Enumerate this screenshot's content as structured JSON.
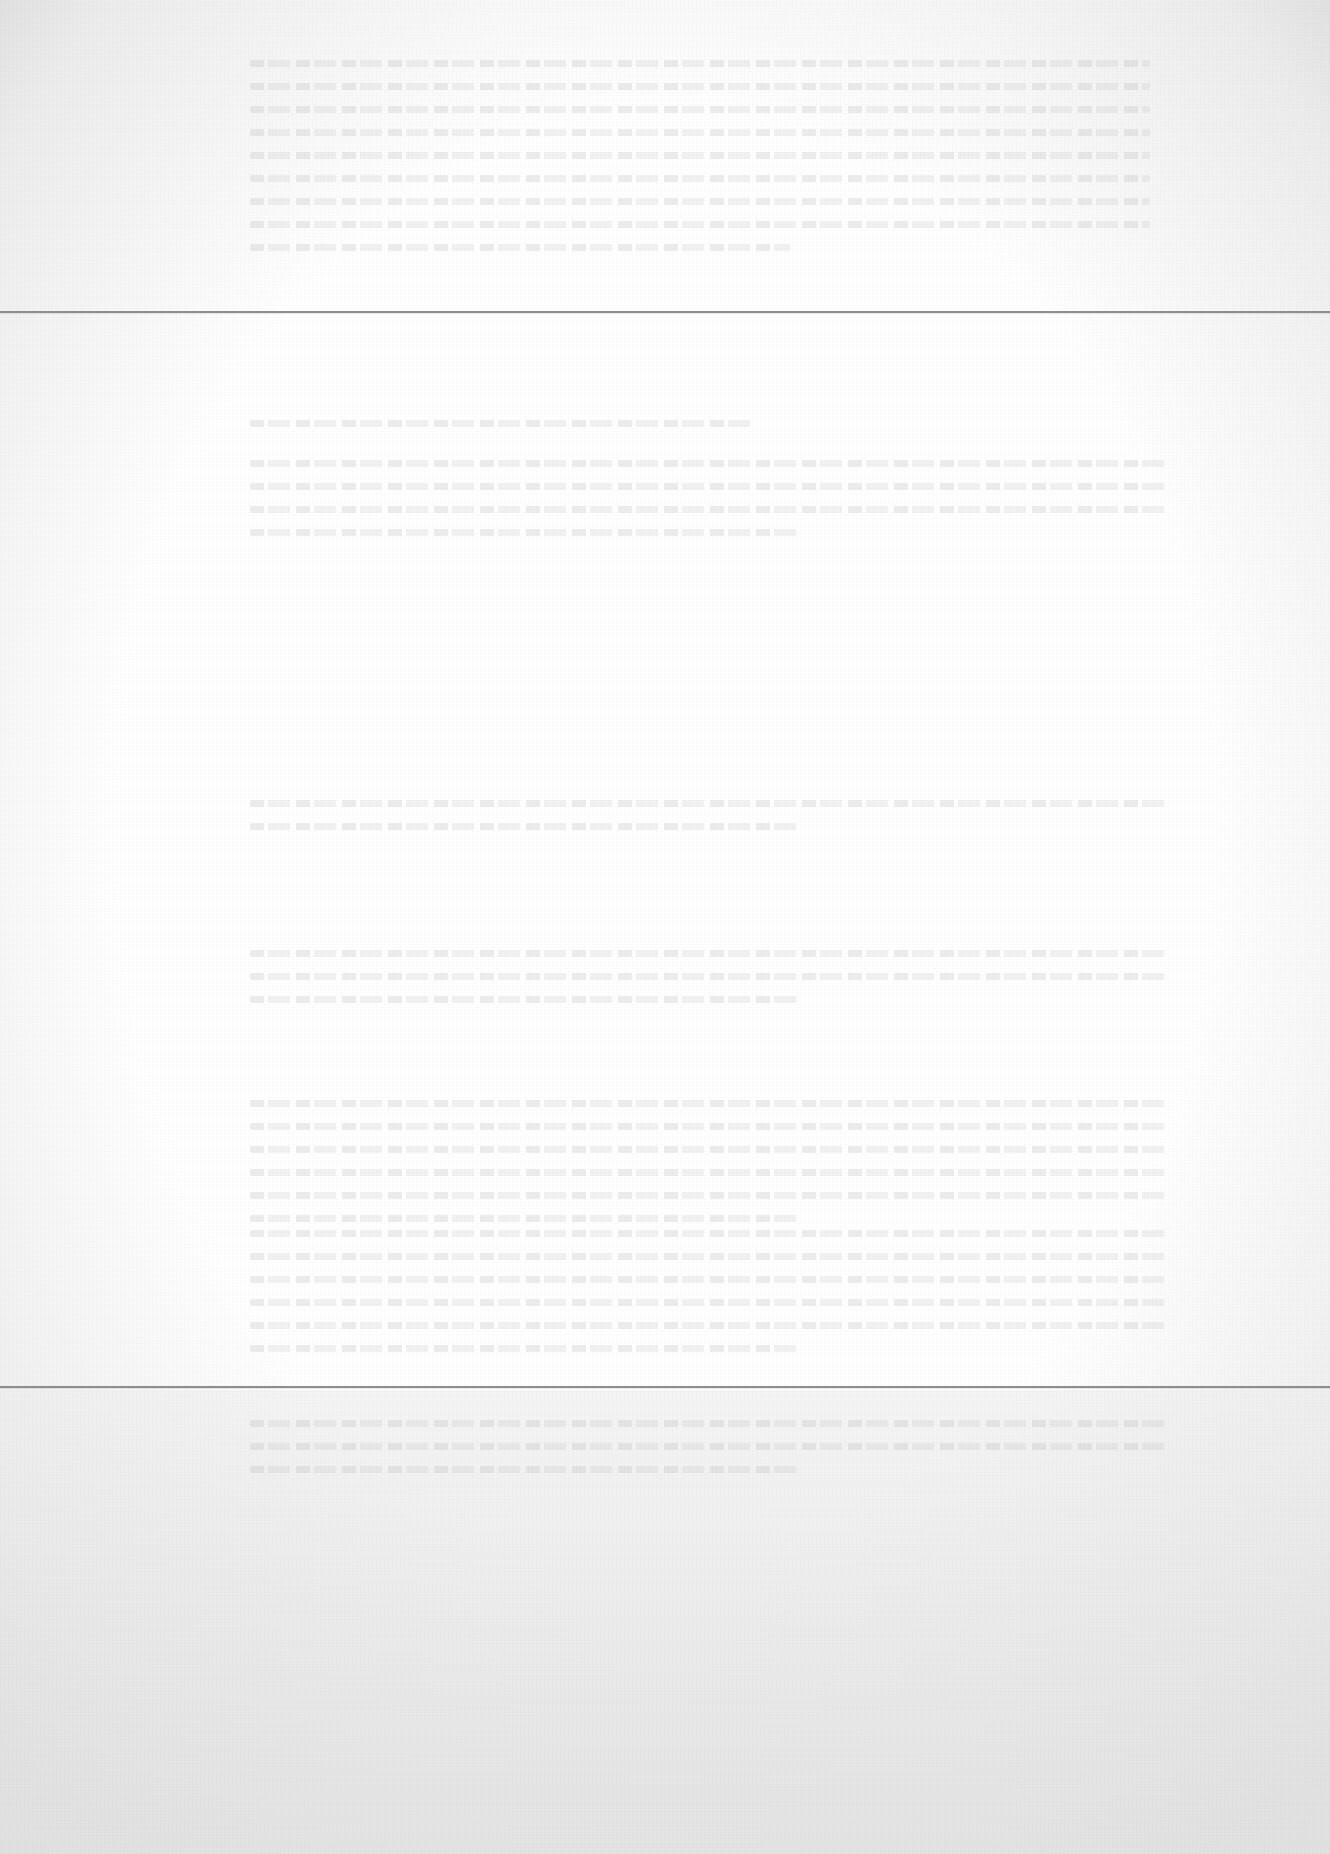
{
  "document": {
    "type": "faded scanned page",
    "legible_text": "",
    "rules": [
      {
        "name": "top-rule",
        "top": 311
      },
      {
        "name": "bottom-rule",
        "top": 1386
      }
    ],
    "text_blocks": [
      {
        "name": "header-block",
        "left": 250,
        "top": 60,
        "width": 900,
        "lines": 9,
        "text": ""
      },
      {
        "name": "section-heading-block",
        "left": 250,
        "top": 420,
        "width": 500,
        "lines": 1,
        "text": ""
      },
      {
        "name": "body-block-1",
        "left": 250,
        "top": 460,
        "width": 920,
        "lines": 4,
        "text": ""
      },
      {
        "name": "body-block-2",
        "left": 250,
        "top": 800,
        "width": 920,
        "lines": 2,
        "text": ""
      },
      {
        "name": "body-block-3",
        "left": 250,
        "top": 950,
        "width": 920,
        "lines": 3,
        "text": ""
      },
      {
        "name": "body-block-4",
        "left": 250,
        "top": 1100,
        "width": 920,
        "lines": 6,
        "text": ""
      },
      {
        "name": "body-block-5",
        "left": 250,
        "top": 1230,
        "width": 920,
        "lines": 6,
        "text": ""
      },
      {
        "name": "footer-block",
        "left": 250,
        "top": 1420,
        "width": 920,
        "lines": 3,
        "text": ""
      }
    ]
  }
}
